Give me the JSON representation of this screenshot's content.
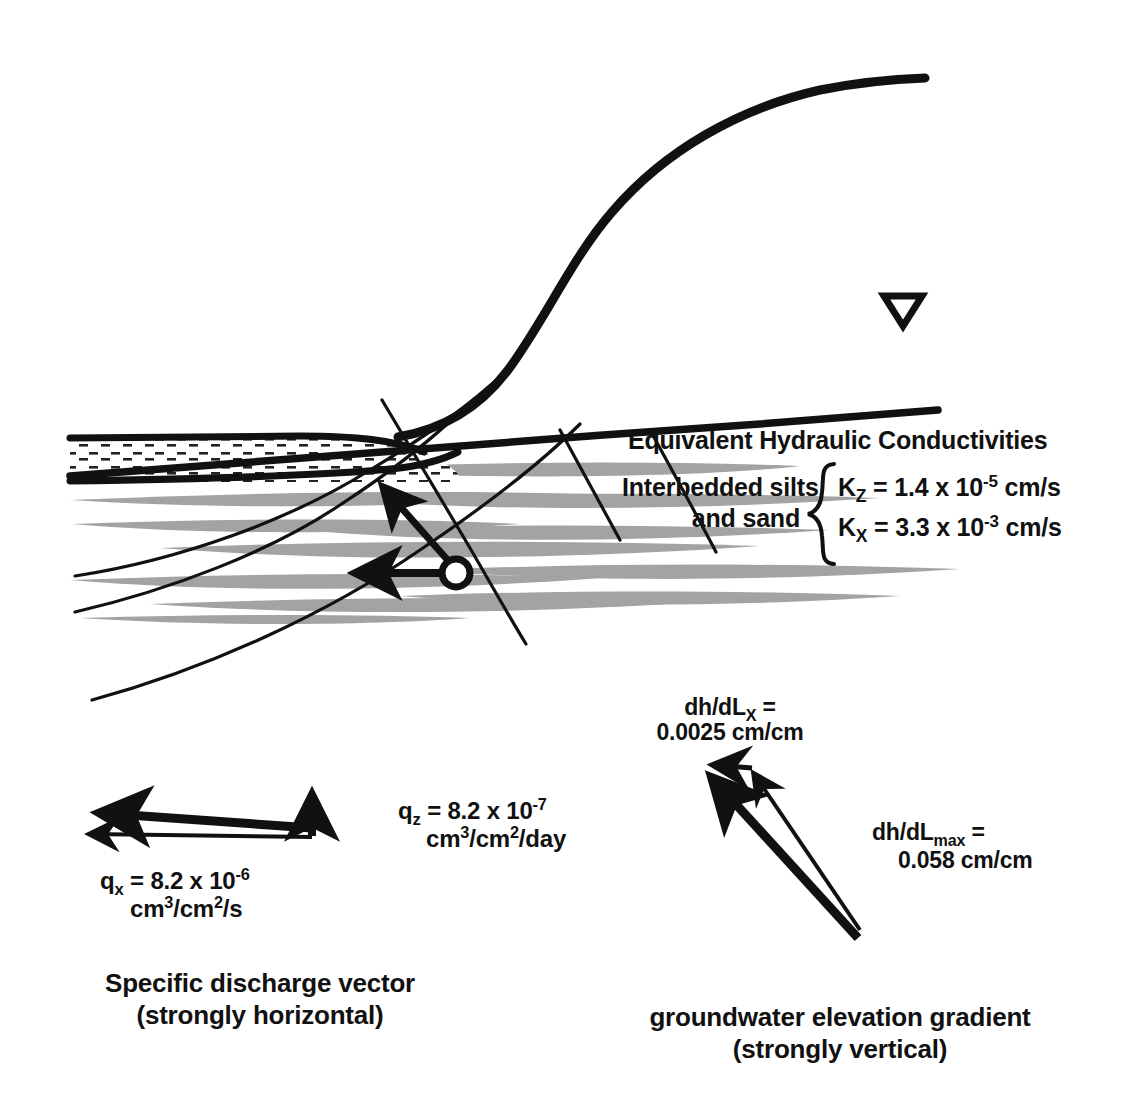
{
  "figure": {
    "kind": "hydrogeologic-cross-section",
    "background_color": "#ffffff",
    "ink_color": "#111111",
    "silt_lens_color": "#a0a0a0"
  },
  "legend": {
    "title": "Equivalent Hydraulic Conductivities",
    "unit_name_line1": "Interbedded silts",
    "unit_name_line2": "and sand",
    "kz": {
      "symbol": "K",
      "subscript": "Z",
      "equals": " = ",
      "mantissa": "1.4 x 10",
      "exponent": "-5",
      "units": " cm/s"
    },
    "kx": {
      "symbol": "K",
      "subscript": "X",
      "equals": " = ",
      "mantissa": "3.3 x 10",
      "exponent": "-3",
      "units": " cm/s"
    }
  },
  "discharge_vector": {
    "qz": {
      "symbol": "q",
      "subscript": "z",
      "equals": " = ",
      "mantissa": "8.2 x 10",
      "exponent": "-7",
      "units_prefix": "cm",
      "units_exp1": "3",
      "units_mid": "/cm",
      "units_exp2": "2",
      "units_suffix": "/day"
    },
    "qx": {
      "symbol": "q",
      "subscript": "x",
      "equals": " = ",
      "mantissa": "8.2 x 10",
      "exponent": "-6",
      "units_prefix": "cm",
      "units_exp1": "3",
      "units_mid": "/cm",
      "units_exp2": "2",
      "units_suffix": "/s"
    },
    "caption_line1": "Specific discharge vector",
    "caption_line2": "(strongly horizontal)"
  },
  "gradient_vector": {
    "dhdlx": {
      "prefix": "dh/dL",
      "subscript": "X",
      "equals": " =",
      "value": "0.0025  cm/cm"
    },
    "dhdlmax": {
      "prefix": "dh/dL",
      "subscript": "max",
      "equals": " =",
      "value": "0.058  cm/cm"
    },
    "caption_line1": "groundwater elevation gradient",
    "caption_line2": "(strongly vertical)"
  },
  "cross_section": {
    "water_table_symbol": "inverted-triangle",
    "land_surface_label": "land-surface",
    "water_table_label": "water-table",
    "measurement_point_label": "observation-point"
  }
}
